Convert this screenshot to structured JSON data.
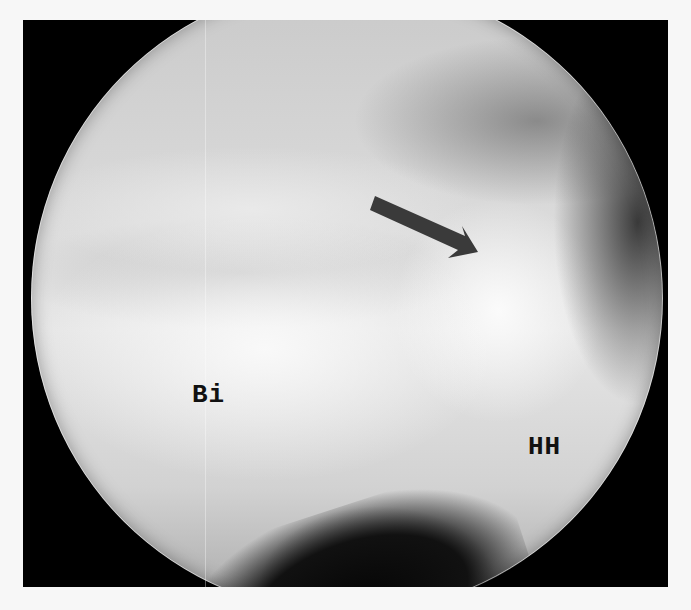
{
  "figure": {
    "type": "arthroscopic-image",
    "colors": {
      "frame": "#000000",
      "page_background": "#f7f7f7",
      "arrow": "#3a3a3a",
      "label_text": "#111111"
    },
    "labels": {
      "biceps": "Bi",
      "humeral_head": "HH"
    },
    "annotations": [
      {
        "kind": "arrow",
        "direction": "down-right",
        "from": [
          375,
          205
        ],
        "to": [
          478,
          250
        ]
      }
    ]
  }
}
